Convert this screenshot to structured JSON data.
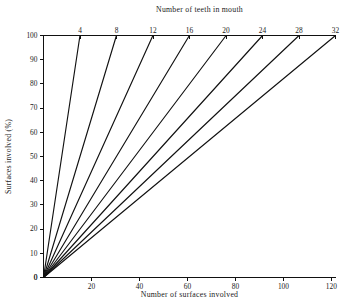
{
  "chart_data": {
    "type": "line",
    "title": "",
    "xlabel": "Number of surfaces involved",
    "ylabel": "Surfaces involved (%)",
    "top_axis_label": "Number of teeth in mouth",
    "xlim": [
      0,
      121.7
    ],
    "ylim": [
      0,
      100
    ],
    "xticks": [
      0,
      20,
      40,
      60,
      80,
      100,
      120
    ],
    "xticklabels": [
      "0",
      "20",
      "40",
      "60",
      "80",
      "100",
      "120"
    ],
    "yticks": [
      0,
      10,
      20,
      30,
      40,
      50,
      60,
      70,
      80,
      90,
      100
    ],
    "yticklabels": [
      "0",
      "10",
      "20",
      "30",
      "40",
      "50",
      "60",
      "70",
      "80",
      "90",
      "100"
    ],
    "top_ticks": [
      4,
      8,
      12,
      16,
      20,
      24,
      28,
      32
    ],
    "top_ticklabels": [
      "4",
      "8",
      "12",
      "16",
      "20",
      "24",
      "28",
      "32"
    ],
    "top_axis_max": 32,
    "surfaces_per_tooth": 3.803,
    "grid": false,
    "legend": null,
    "line_color": "#111111",
    "series": [
      {
        "name": "4 teeth",
        "teeth": 4,
        "x": [
          0,
          15.2
        ],
        "values": [
          0,
          100
        ]
      },
      {
        "name": "8 teeth",
        "teeth": 8,
        "x": [
          0,
          30.4
        ],
        "values": [
          0,
          100
        ]
      },
      {
        "name": "12 teeth",
        "teeth": 12,
        "x": [
          0,
          45.6
        ],
        "values": [
          0,
          100
        ]
      },
      {
        "name": "16 teeth",
        "teeth": 16,
        "x": [
          0,
          60.8
        ],
        "values": [
          0,
          100
        ]
      },
      {
        "name": "20 teeth",
        "teeth": 20,
        "x": [
          0,
          76.1
        ],
        "values": [
          0,
          100
        ]
      },
      {
        "name": "24 teeth",
        "teeth": 24,
        "x": [
          0,
          91.3
        ],
        "values": [
          0,
          100
        ]
      },
      {
        "name": "28 teeth",
        "teeth": 28,
        "x": [
          0,
          106.5
        ],
        "values": [
          0,
          100
        ]
      },
      {
        "name": "32 teeth",
        "teeth": 32,
        "x": [
          0,
          121.7
        ],
        "values": [
          0,
          100
        ]
      }
    ]
  }
}
